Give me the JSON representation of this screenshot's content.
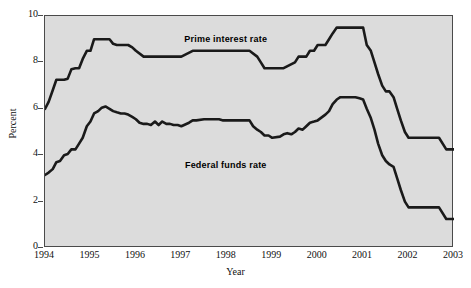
{
  "chart_data": {
    "type": "line",
    "title": "",
    "xlabel": "Year",
    "ylabel": "Percent",
    "xlim": [
      1994,
      2003
    ],
    "ylim": [
      0,
      10
    ],
    "ytick_labels": [
      "0",
      "2",
      "4",
      "6",
      "8",
      "10"
    ],
    "ytick_values": [
      0,
      2,
      4,
      6,
      8,
      10
    ],
    "xtick_labels": [
      "1994",
      "1995",
      "1996",
      "1997",
      "1998",
      "1999",
      "2000",
      "2001",
      "2002",
      "2003"
    ],
    "xtick_values": [
      1994,
      1995,
      1996,
      1997,
      1998,
      1999,
      2000,
      2001,
      2002,
      2003
    ],
    "grid": false,
    "legend_position": "inline-annotations",
    "plot_background": "#dcdcdc",
    "line_color": "#1a1a1a",
    "series": [
      {
        "name": "Prime interest rate",
        "label_x": 1998.0,
        "label_y": 8.95,
        "x": [
          1994.0,
          1994.08,
          1994.17,
          1994.25,
          1994.33,
          1994.42,
          1994.5,
          1994.58,
          1994.67,
          1994.75,
          1994.83,
          1994.92,
          1995.0,
          1995.08,
          1995.17,
          1995.25,
          1995.33,
          1995.42,
          1995.5,
          1995.58,
          1995.67,
          1995.75,
          1995.83,
          1995.92,
          1996.0,
          1996.17,
          1996.33,
          1996.5,
          1996.75,
          1997.0,
          1997.25,
          1997.33,
          1997.5,
          1997.75,
          1998.0,
          1998.25,
          1998.5,
          1998.67,
          1998.75,
          1998.83,
          1998.92,
          1999.0,
          1999.25,
          1999.5,
          1999.58,
          1999.67,
          1999.75,
          1999.83,
          1999.92,
          2000.0,
          2000.17,
          2000.25,
          2000.33,
          2000.42,
          2000.5,
          2000.58,
          2000.75,
          2000.92,
          2001.0,
          2001.08,
          2001.17,
          2001.25,
          2001.33,
          2001.42,
          2001.5,
          2001.58,
          2001.67,
          2001.75,
          2001.83,
          2001.92,
          2002.0,
          2002.25,
          2002.5,
          2002.67,
          2002.83,
          2002.92,
          2003.0
        ],
        "y": [
          6.0,
          6.3,
          6.8,
          7.25,
          7.25,
          7.25,
          7.3,
          7.7,
          7.75,
          7.75,
          8.15,
          8.5,
          8.5,
          9.0,
          9.0,
          9.0,
          9.0,
          9.0,
          8.8,
          8.75,
          8.75,
          8.75,
          8.75,
          8.65,
          8.5,
          8.25,
          8.25,
          8.25,
          8.25,
          8.25,
          8.5,
          8.5,
          8.5,
          8.5,
          8.5,
          8.5,
          8.5,
          8.25,
          8.0,
          7.75,
          7.75,
          7.75,
          7.75,
          8.0,
          8.25,
          8.25,
          8.25,
          8.5,
          8.5,
          8.75,
          8.75,
          9.0,
          9.25,
          9.5,
          9.5,
          9.5,
          9.5,
          9.5,
          9.5,
          8.75,
          8.5,
          8.0,
          7.5,
          7.0,
          6.75,
          6.75,
          6.5,
          6.0,
          5.5,
          5.0,
          4.75,
          4.75,
          4.75,
          4.75,
          4.25,
          4.25,
          4.25
        ]
      },
      {
        "name": "Federal funds rate",
        "label_x": 1998.0,
        "label_y": 3.55,
        "x": [
          1994.0,
          1994.08,
          1994.17,
          1994.25,
          1994.33,
          1994.42,
          1994.5,
          1994.58,
          1994.67,
          1994.75,
          1994.83,
          1994.92,
          1995.0,
          1995.08,
          1995.17,
          1995.25,
          1995.33,
          1995.42,
          1995.5,
          1995.58,
          1995.67,
          1995.75,
          1995.83,
          1995.92,
          1996.0,
          1996.08,
          1996.17,
          1996.25,
          1996.33,
          1996.42,
          1996.5,
          1996.58,
          1996.67,
          1996.75,
          1996.83,
          1996.92,
          1997.0,
          1997.17,
          1997.25,
          1997.33,
          1997.5,
          1997.67,
          1997.83,
          1997.92,
          1998.0,
          1998.17,
          1998.33,
          1998.5,
          1998.58,
          1998.67,
          1998.75,
          1998.83,
          1998.92,
          1999.0,
          1999.17,
          1999.25,
          1999.33,
          1999.42,
          1999.5,
          1999.58,
          1999.67,
          1999.75,
          1999.83,
          1999.92,
          2000.0,
          2000.17,
          2000.25,
          2000.33,
          2000.42,
          2000.5,
          2000.58,
          2000.67,
          2000.83,
          2000.92,
          2001.0,
          2001.08,
          2001.17,
          2001.25,
          2001.33,
          2001.42,
          2001.5,
          2001.58,
          2001.67,
          2001.75,
          2001.83,
          2001.92,
          2002.0,
          2002.25,
          2002.5,
          2002.67,
          2002.83,
          2002.92,
          2003.0
        ],
        "y": [
          3.15,
          3.25,
          3.4,
          3.7,
          3.75,
          4.0,
          4.05,
          4.25,
          4.25,
          4.5,
          4.75,
          5.25,
          5.45,
          5.8,
          5.9,
          6.05,
          6.1,
          6.0,
          5.9,
          5.85,
          5.8,
          5.8,
          5.75,
          5.65,
          5.55,
          5.4,
          5.35,
          5.35,
          5.3,
          5.45,
          5.3,
          5.45,
          5.35,
          5.35,
          5.3,
          5.3,
          5.25,
          5.4,
          5.5,
          5.5,
          5.55,
          5.55,
          5.55,
          5.5,
          5.5,
          5.5,
          5.5,
          5.5,
          5.25,
          5.1,
          5.0,
          4.85,
          4.85,
          4.75,
          4.8,
          4.9,
          4.95,
          4.9,
          5.0,
          5.15,
          5.1,
          5.25,
          5.4,
          5.45,
          5.5,
          5.75,
          5.9,
          6.2,
          6.4,
          6.5,
          6.5,
          6.5,
          6.5,
          6.45,
          6.4,
          6.0,
          5.6,
          5.1,
          4.5,
          4.0,
          3.75,
          3.6,
          3.5,
          3.0,
          2.5,
          2.0,
          1.75,
          1.75,
          1.75,
          1.75,
          1.25,
          1.25,
          1.25
        ]
      }
    ]
  },
  "axes": {
    "ylabel": "Percent",
    "xlabel": "Year"
  },
  "annotations": {
    "prime": "Prime interest rate",
    "funds": "Federal funds rate"
  }
}
